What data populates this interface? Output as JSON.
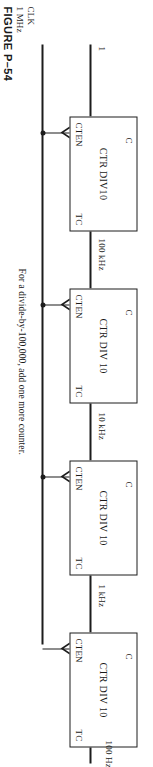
{
  "figure": {
    "caption": "FIGURE P–54",
    "note": "For a divide-by-100,000, add one more counter.",
    "clock": {
      "name": "CLK",
      "frequency": "1 MHz"
    },
    "enable_input_label": "1",
    "output_label": "100 Hz"
  },
  "pins": {
    "enable": "CTEN",
    "terminal_count": "TC",
    "clock": "C"
  },
  "counters": [
    {
      "title": "CTR DIV10",
      "output_frequency": "100 kHz"
    },
    {
      "title": "CTR DIV 10",
      "output_frequency": "10 kHz"
    },
    {
      "title": "CTR DIV 10",
      "output_frequency": "1 kHz"
    },
    {
      "title": "CTR DIV 10",
      "output_frequency": "100 Hz"
    }
  ],
  "colors": {
    "ink": "#1c1c1c",
    "paper": "#ffffff"
  }
}
